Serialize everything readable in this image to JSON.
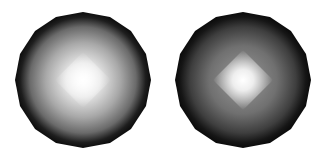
{
  "figure": {
    "spheres": [
      {
        "id": "left",
        "highlight": "broad diamond highlight",
        "rim_color": "#111111",
        "center_color": "#ffffff",
        "mid_color": "#9a9a9a"
      },
      {
        "id": "right",
        "highlight": "sharp diamond highlight",
        "rim_color": "#111111",
        "center_color": "#ffffff",
        "mid_color": "#6e6e6e"
      }
    ]
  }
}
